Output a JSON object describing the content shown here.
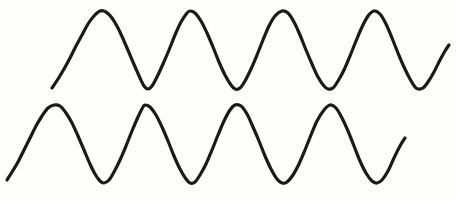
{
  "figure": {
    "kind": "sine-wave-pair-sketch",
    "width": 456,
    "height": 199,
    "background_color": "#fdfdfc",
    "stroke_color": "#1a1a1a",
    "stroke_width": 3.2,
    "label": ""
  },
  "chart_data": {
    "type": "line",
    "title": "",
    "subtitle": "",
    "xlabel": "",
    "ylabel": "",
    "grid": false,
    "legend_position": "none",
    "axis_visible": false,
    "tick_labels": {
      "x": [],
      "y": []
    },
    "xlim": [
      0,
      456
    ],
    "ylim": [
      199,
      0
    ],
    "annotations": [],
    "series": [
      {
        "name": "upper-wave",
        "stroke_color": "#1a1a1a",
        "period_px": 91,
        "amplitude_px": 39,
        "center_y_px": 50,
        "peak_y_px": 11,
        "trough_y_px": 89,
        "start_point": [
          52,
          88
        ],
        "end_point": [
          449,
          45
        ],
        "peaks_x": [
          100,
          190,
          282,
          374
        ],
        "troughs_x": [
          144,
          235,
          328,
          418
        ],
        "points": [
          [
            52,
            88
          ],
          [
            58,
            79
          ],
          [
            64,
            69
          ],
          [
            70,
            58
          ],
          [
            76,
            46
          ],
          [
            82,
            35
          ],
          [
            88,
            24
          ],
          [
            94,
            16
          ],
          [
            100,
            11
          ],
          [
            106,
            12
          ],
          [
            112,
            18
          ],
          [
            118,
            28
          ],
          [
            124,
            41
          ],
          [
            130,
            55
          ],
          [
            136,
            69
          ],
          [
            140,
            78
          ],
          [
            144,
            86
          ],
          [
            148,
            89
          ],
          [
            152,
            86
          ],
          [
            157,
            77
          ],
          [
            163,
            64
          ],
          [
            169,
            50
          ],
          [
            175,
            35
          ],
          [
            181,
            22
          ],
          [
            187,
            13
          ],
          [
            190,
            11
          ],
          [
            195,
            13
          ],
          [
            201,
            21
          ],
          [
            207,
            33
          ],
          [
            213,
            47
          ],
          [
            219,
            62
          ],
          [
            225,
            75
          ],
          [
            231,
            85
          ],
          [
            235,
            89
          ],
          [
            240,
            88
          ],
          [
            245,
            81
          ],
          [
            251,
            69
          ],
          [
            257,
            55
          ],
          [
            263,
            40
          ],
          [
            269,
            26
          ],
          [
            275,
            16
          ],
          [
            282,
            11
          ],
          [
            288,
            13
          ],
          [
            294,
            22
          ],
          [
            300,
            35
          ],
          [
            306,
            50
          ],
          [
            312,
            64
          ],
          [
            318,
            77
          ],
          [
            324,
            86
          ],
          [
            328,
            89
          ],
          [
            333,
            88
          ],
          [
            338,
            81
          ],
          [
            344,
            70
          ],
          [
            350,
            56
          ],
          [
            356,
            41
          ],
          [
            362,
            27
          ],
          [
            368,
            16
          ],
          [
            374,
            11
          ],
          [
            380,
            14
          ],
          [
            386,
            24
          ],
          [
            392,
            38
          ],
          [
            398,
            53
          ],
          [
            404,
            67
          ],
          [
            410,
            79
          ],
          [
            415,
            87
          ],
          [
            418,
            89
          ],
          [
            423,
            88
          ],
          [
            428,
            82
          ],
          [
            434,
            72
          ],
          [
            440,
            60
          ],
          [
            445,
            51
          ],
          [
            449,
            45
          ]
        ]
      },
      {
        "name": "lower-wave",
        "stroke_color": "#1a1a1a",
        "period_px": 91,
        "amplitude_px": 39,
        "center_y_px": 144,
        "peak_y_px": 105,
        "trough_y_px": 183,
        "start_point": [
          7,
          180
        ],
        "end_point": [
          405,
          138
        ],
        "peaks_x": [
          54,
          145,
          235,
          330
        ],
        "troughs_x": [
          100,
          190,
          282,
          377
        ],
        "points": [
          [
            7,
            180
          ],
          [
            12,
            172
          ],
          [
            18,
            162
          ],
          [
            24,
            150
          ],
          [
            30,
            138
          ],
          [
            36,
            126
          ],
          [
            42,
            116
          ],
          [
            48,
            108
          ],
          [
            54,
            105
          ],
          [
            60,
            106
          ],
          [
            66,
            113
          ],
          [
            72,
            123
          ],
          [
            78,
            136
          ],
          [
            84,
            150
          ],
          [
            90,
            164
          ],
          [
            95,
            174
          ],
          [
            100,
            181
          ],
          [
            104,
            183
          ],
          [
            109,
            180
          ],
          [
            114,
            172
          ],
          [
            120,
            160
          ],
          [
            126,
            146
          ],
          [
            132,
            131
          ],
          [
            138,
            117
          ],
          [
            143,
            107
          ],
          [
            145,
            105
          ],
          [
            150,
            107
          ],
          [
            156,
            115
          ],
          [
            162,
            127
          ],
          [
            168,
            141
          ],
          [
            174,
            156
          ],
          [
            180,
            169
          ],
          [
            186,
            179
          ],
          [
            190,
            183
          ],
          [
            195,
            182
          ],
          [
            200,
            175
          ],
          [
            206,
            164
          ],
          [
            212,
            150
          ],
          [
            218,
            135
          ],
          [
            224,
            121
          ],
          [
            230,
            110
          ],
          [
            235,
            105
          ],
          [
            241,
            106
          ],
          [
            247,
            114
          ],
          [
            253,
            127
          ],
          [
            259,
            141
          ],
          [
            265,
            156
          ],
          [
            271,
            169
          ],
          [
            277,
            179
          ],
          [
            282,
            183
          ],
          [
            287,
            182
          ],
          [
            293,
            175
          ],
          [
            299,
            164
          ],
          [
            305,
            150
          ],
          [
            311,
            135
          ],
          [
            317,
            121
          ],
          [
            324,
            110
          ],
          [
            330,
            105
          ],
          [
            336,
            108
          ],
          [
            342,
            118
          ],
          [
            348,
            131
          ],
          [
            354,
            146
          ],
          [
            360,
            161
          ],
          [
            366,
            173
          ],
          [
            372,
            181
          ],
          [
            377,
            183
          ],
          [
            382,
            180
          ],
          [
            388,
            171
          ],
          [
            394,
            158
          ],
          [
            400,
            146
          ],
          [
            405,
            138
          ]
        ]
      }
    ]
  }
}
